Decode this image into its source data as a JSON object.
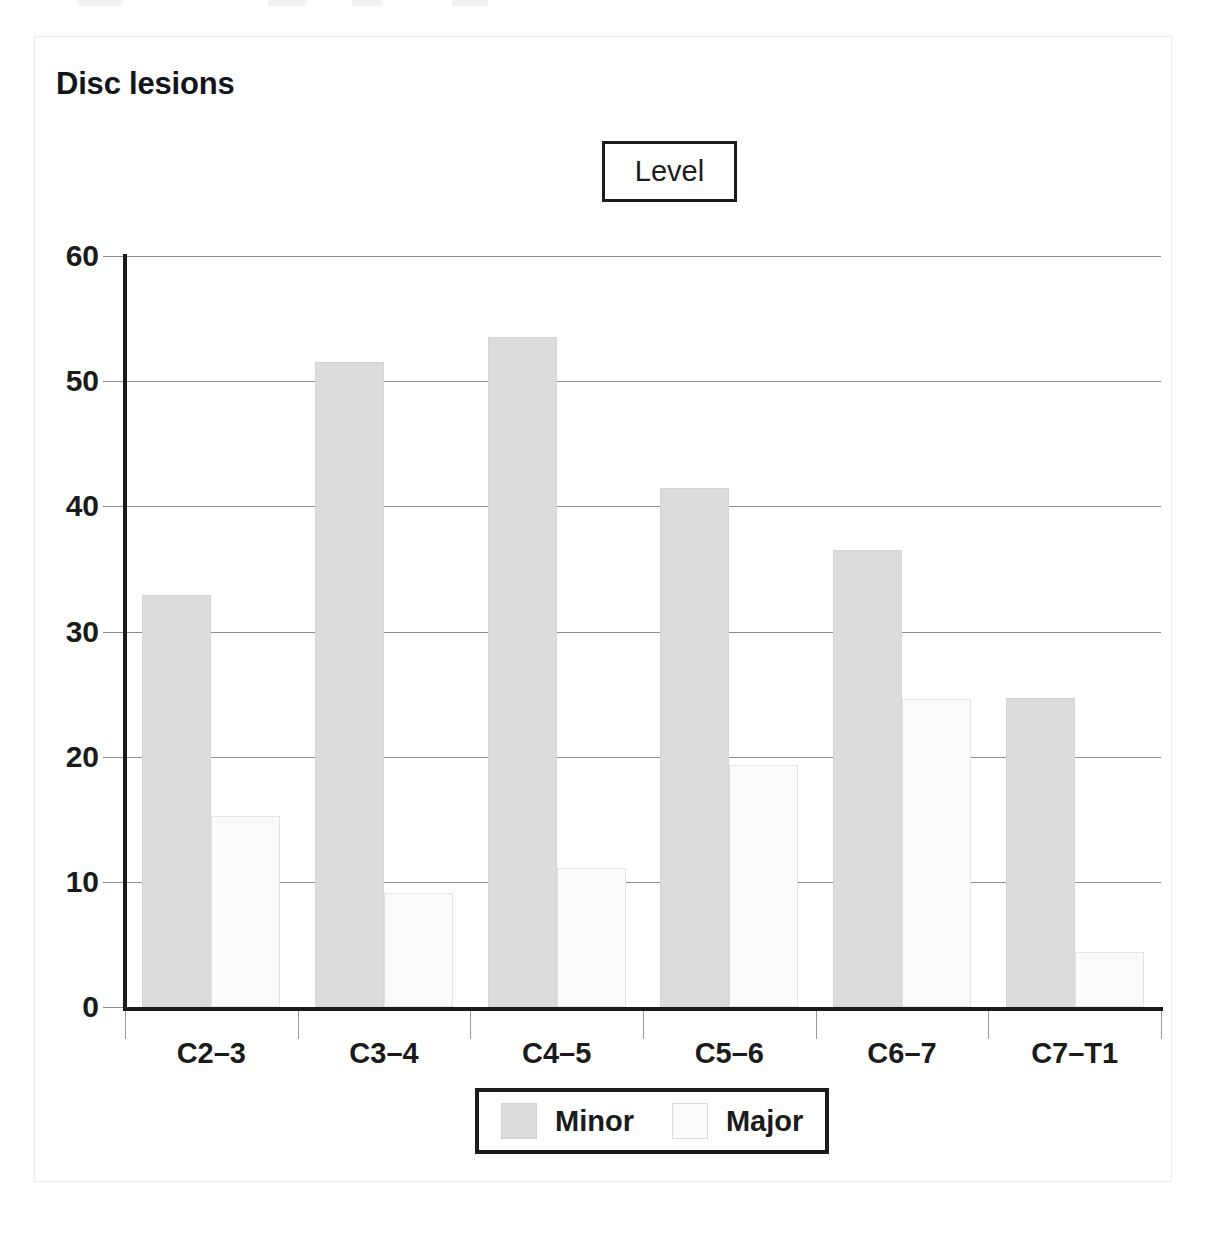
{
  "card": {
    "title": "Disc lesions",
    "strip_title": "Level"
  },
  "chart_data": {
    "type": "bar",
    "title": "Disc lesions",
    "strip_title": "Level",
    "xlabel": "",
    "ylabel": "",
    "ylim": [
      0,
      60
    ],
    "yticks": [
      0,
      10,
      20,
      30,
      40,
      50,
      60
    ],
    "ytick_labels": [
      "0",
      "10",
      "20",
      "30",
      "40",
      "50",
      "60"
    ],
    "grid": true,
    "grid_axis": "y",
    "legend_position": "bottom",
    "categories": [
      "C2–3",
      "C3–4",
      "C4–5",
      "C5–6",
      "C6–7",
      "C7–T1"
    ],
    "series": [
      {
        "name": "Minor",
        "color": "#dcdcdc",
        "values": [
          32.9,
          51.5,
          53.5,
          41.5,
          36.5,
          24.7
        ]
      },
      {
        "name": "Major",
        "color": "#fbfbfb",
        "values": [
          15.3,
          9.1,
          11.1,
          19.3,
          24.6,
          4.4
        ]
      }
    ]
  }
}
